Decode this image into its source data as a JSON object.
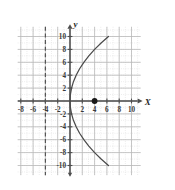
{
  "chart_data": {
    "type": "line",
    "title": "",
    "xlabel": "x",
    "ylabel": "y",
    "xlim": [
      -8.5,
      11.5
    ],
    "ylim": [
      -11.5,
      11.5
    ],
    "grid": true,
    "minor_grid": true,
    "legend": "none",
    "xticks": [
      -8,
      -6,
      -4,
      -2,
      2,
      4,
      6,
      8,
      10
    ],
    "yticks": [
      -10,
      -8,
      -6,
      -4,
      -2,
      2,
      4,
      6,
      8,
      10
    ],
    "xtick_labels": [
      "-8",
      "-6",
      "-4",
      "-2",
      "2",
      "4",
      "6",
      "8",
      "10"
    ],
    "ytick_labels": [
      "-10",
      "-8",
      "-6",
      "-4",
      "-2",
      "2",
      "4",
      "6",
      "8",
      "10"
    ],
    "series": [
      {
        "name": "parabola",
        "equation": "y^2 = 16x",
        "style": "solid",
        "color": "#4a4a4a",
        "points": [
          [
            6.25,
            -10.0
          ],
          [
            5.06,
            -9.0
          ],
          [
            4.0,
            -8.0
          ],
          [
            3.06,
            -7.0
          ],
          [
            2.25,
            -6.0
          ],
          [
            1.56,
            -5.0
          ],
          [
            1.0,
            -4.0
          ],
          [
            0.56,
            -3.0
          ],
          [
            0.25,
            -2.0
          ],
          [
            0.06,
            -1.0
          ],
          [
            0.0,
            0.0
          ],
          [
            0.06,
            1.0
          ],
          [
            0.25,
            2.0
          ],
          [
            0.56,
            3.0
          ],
          [
            1.0,
            4.0
          ],
          [
            1.56,
            5.0
          ],
          [
            2.25,
            6.0
          ],
          [
            3.06,
            7.0
          ],
          [
            4.0,
            8.0
          ],
          [
            5.06,
            9.0
          ],
          [
            6.25,
            10.0
          ]
        ]
      }
    ],
    "vertical_lines": [
      {
        "name": "directrix",
        "x": -4,
        "style": "dashed",
        "color": "#555555"
      }
    ],
    "points": [
      {
        "name": "focus",
        "x": 4,
        "y": 0,
        "marker": "filled-circle",
        "color": "#1a1a1a"
      }
    ],
    "annotations": []
  },
  "labels": {
    "x_axis": "X",
    "y_axis": "y"
  },
  "colors": {
    "background": "#ffffff",
    "axis": "#4d4d4d",
    "major_grid": "#b9b9b9",
    "minor_grid": "#d8d8d8",
    "curve": "#4a4a4a",
    "directrix": "#555555",
    "point": "#1a1a1a",
    "tick_text": "#3a3a3a"
  }
}
